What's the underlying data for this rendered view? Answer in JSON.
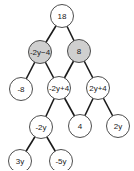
{
  "diagram": {
    "type": "tree",
    "colors": {
      "highlight_fill": "#cfcfcf",
      "normal_fill": "#ffffff",
      "stroke": "#3a3a3a",
      "edge": "#1a1a1a"
    },
    "nodes": [
      {
        "id": "n18",
        "label": "18",
        "highlighted": false
      },
      {
        "id": "n_m2ym4",
        "label": "-2y−4",
        "highlighted": true
      },
      {
        "id": "n8",
        "label": "8",
        "highlighted": true
      },
      {
        "id": "n_m8",
        "label": "-8",
        "highlighted": false
      },
      {
        "id": "n_m2yp4",
        "label": "-2y+4",
        "highlighted": false
      },
      {
        "id": "n_2yp4",
        "label": "2y+4",
        "highlighted": false
      },
      {
        "id": "n_m2y",
        "label": "-2y",
        "highlighted": false
      },
      {
        "id": "n4",
        "label": "4",
        "highlighted": false
      },
      {
        "id": "n2y",
        "label": "2y",
        "highlighted": false
      },
      {
        "id": "n3y",
        "label": "3y",
        "highlighted": false
      },
      {
        "id": "n_m5y",
        "label": "-5y",
        "highlighted": false
      }
    ],
    "edges": [
      [
        "n18",
        "n_m2ym4"
      ],
      [
        "n18",
        "n8"
      ],
      [
        "n_m2ym4",
        "n_m8"
      ],
      [
        "n_m2ym4",
        "n_m2yp4"
      ],
      [
        "n8",
        "n_m2yp4"
      ],
      [
        "n8",
        "n_2yp4"
      ],
      [
        "n_m2yp4",
        "n_m2y"
      ],
      [
        "n_m2yp4",
        "n4"
      ],
      [
        "n_2yp4",
        "n4"
      ],
      [
        "n_2yp4",
        "n2y"
      ],
      [
        "n_m2y",
        "n3y"
      ],
      [
        "n_m2y",
        "n_m5y"
      ]
    ]
  }
}
